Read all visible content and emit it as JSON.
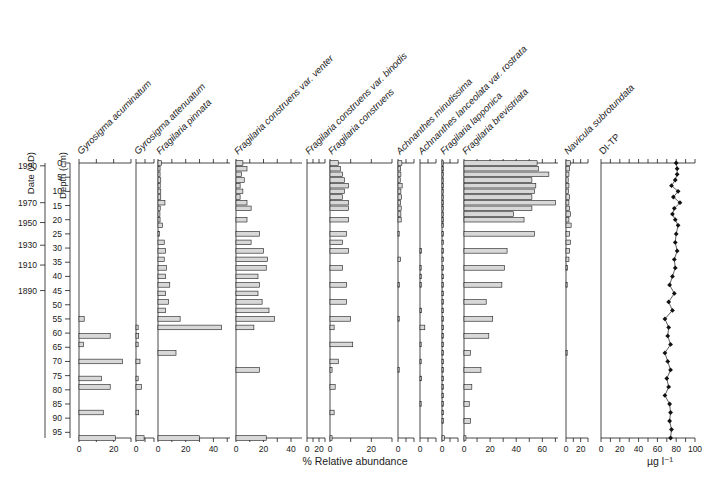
{
  "figure": {
    "type": "stratigraphic-diatom-diagram",
    "x_axis_title": "% Relative abundance",
    "ditp_axis_title": "µg l⁻¹",
    "date_axis_label": "Date (AD)",
    "depth_axis_label": "Depth (cm)"
  },
  "depths": [
    0,
    2,
    4,
    6,
    8,
    10,
    12,
    14,
    16,
    18,
    20,
    22,
    25,
    28,
    31,
    34,
    37,
    40,
    43,
    46,
    49,
    52,
    55,
    58,
    61,
    64,
    67,
    70,
    73,
    76,
    79,
    82,
    85,
    88,
    91,
    94,
    97
  ],
  "depth_ticks": [
    0,
    5,
    10,
    15,
    20,
    25,
    30,
    35,
    40,
    45,
    50,
    55,
    60,
    65,
    70,
    75,
    80,
    85,
    90,
    95
  ],
  "date_ticks": [
    {
      "label": "1990",
      "depth": 1
    },
    {
      "label": "1970",
      "depth": 14
    },
    {
      "label": "1950",
      "depth": 21
    },
    {
      "label": "1930",
      "depth": 29
    },
    {
      "label": "1910",
      "depth": 36
    },
    {
      "label": "1890",
      "depth": 45
    }
  ],
  "chart_data": {
    "type": "bar",
    "title": "",
    "xlabel": "% Relative abundance",
    "ylabel": "Depth (cm)",
    "ylim": [
      0,
      97
    ],
    "grid": false,
    "legend": "none",
    "orientation": "horizontal-bars-by-depth",
    "panels": [
      {
        "name": "Gyrosigma acuminatum",
        "italic": true,
        "units": "%",
        "xlim": [
          0,
          30
        ],
        "ticks": [
          0,
          10,
          20,
          30
        ],
        "tick_labels": [
          "0",
          "",
          "20",
          ""
        ],
        "values": [
          0,
          0,
          0,
          0,
          0,
          0,
          0,
          0,
          0,
          0,
          0,
          0,
          0,
          0,
          0,
          0,
          0,
          0,
          0,
          0,
          0,
          0,
          3,
          0,
          18,
          2.5,
          0,
          25,
          0,
          13,
          18,
          0,
          0,
          14,
          0,
          0,
          21
        ]
      },
      {
        "name": "Gyrosigma attenuatum",
        "italic": true,
        "units": "%",
        "xlim": [
          0,
          10
        ],
        "ticks": [
          0,
          5,
          10
        ],
        "tick_labels": [
          "0",
          "",
          ""
        ],
        "values": [
          0,
          0,
          0,
          0,
          0,
          0,
          0,
          0,
          0,
          0,
          0,
          0,
          0,
          0,
          0,
          0,
          0,
          0,
          0,
          0,
          0,
          0,
          0,
          1.2,
          1.5,
          1.2,
          0,
          2.2,
          0,
          1.2,
          3,
          0,
          0,
          1.5,
          0,
          0,
          4.5
        ]
      },
      {
        "name": "Fragilaria pinnata",
        "italic": true,
        "units": "%",
        "xlim": [
          0,
          52
        ],
        "ticks": [
          0,
          10,
          20,
          30,
          40,
          50
        ],
        "tick_labels": [
          "0",
          "",
          "20",
          "",
          "40",
          ""
        ],
        "values": [
          2.5,
          1.5,
          1.5,
          2.0,
          1.6,
          2.0,
          2.0,
          5.0,
          1.6,
          1.4,
          1.5,
          3.2,
          1.0,
          4.5,
          5.5,
          4.5,
          6.0,
          5.5,
          8.5,
          5.5,
          7.5,
          5.5,
          16,
          46,
          0,
          0,
          13,
          0,
          0,
          0,
          0,
          0,
          0,
          0,
          0,
          0,
          30
        ]
      },
      {
        "name": "Fragilaria construens var. venter",
        "italic": true,
        "units": "%",
        "xlim": [
          0,
          48
        ],
        "ticks": [
          0,
          10,
          20,
          30,
          40
        ],
        "tick_labels": [
          "0",
          "",
          "20",
          "",
          "40"
        ],
        "values": [
          5,
          8,
          4,
          6,
          3,
          5,
          3,
          8,
          11,
          0,
          8,
          0,
          17,
          11,
          20,
          23,
          22,
          16,
          17,
          16,
          19,
          24,
          28,
          13,
          0,
          0,
          0,
          0,
          17,
          0,
          0,
          0,
          0,
          0,
          0,
          0,
          22
        ]
      },
      {
        "name": "Fragilaria construens var. binodis",
        "italic": true,
        "units": "%",
        "xlim": [
          0,
          30
        ],
        "ticks": [
          0,
          10,
          20,
          30
        ],
        "tick_labels": [
          "0",
          "",
          "20",
          ""
        ],
        "values": [
          0,
          0,
          0,
          0,
          0,
          0,
          0,
          0,
          0,
          0,
          0,
          0,
          0,
          0,
          0,
          0,
          0,
          0,
          0,
          0,
          0,
          0,
          0,
          0,
          0,
          0,
          0,
          0,
          0,
          0,
          0,
          0,
          0,
          0,
          0,
          0,
          0
        ]
      },
      {
        "name": "Fragilaria construens",
        "italic": true,
        "units": "%",
        "xlim": [
          0,
          30
        ],
        "ticks": [
          0,
          10,
          20,
          30
        ],
        "tick_labels": [
          "0",
          "",
          "20",
          ""
        ],
        "values": [
          4,
          5,
          6,
          7,
          9,
          7,
          6,
          9,
          9,
          0,
          9,
          0,
          8,
          6,
          9,
          0,
          6,
          0,
          8,
          0,
          8,
          0,
          10,
          2,
          0,
          11,
          0,
          4,
          1,
          0,
          2.5,
          0,
          0,
          2,
          0,
          0,
          1
        ]
      },
      {
        "name": "Achnanthes minutissima",
        "italic": true,
        "units": "%",
        "xlim": [
          0,
          10
        ],
        "ticks": [
          0,
          5,
          10
        ],
        "tick_labels": [
          "0",
          "",
          ""
        ],
        "values": [
          2.4,
          1.6,
          1.8,
          1.4,
          2.6,
          1.8,
          2.2,
          1.6,
          2.0,
          1.8,
          2.0,
          0,
          0.7,
          0,
          0,
          1.6,
          0,
          0,
          0.8,
          0,
          0,
          0,
          0.7,
          0,
          0,
          0,
          0,
          0,
          0.6,
          0,
          0,
          0,
          0,
          0,
          0,
          0,
          0
        ]
      },
      {
        "name": "Achnanthes lanceolata var. rostrata",
        "italic": true,
        "units": "%",
        "xlim": [
          0,
          10
        ],
        "ticks": [
          0,
          5,
          10
        ],
        "tick_labels": [
          "0",
          "",
          ""
        ],
        "values": [
          0,
          0,
          0,
          0,
          0,
          0,
          0,
          0,
          0,
          0,
          0,
          0,
          0,
          0,
          1.0,
          0,
          0.5,
          0.8,
          0.8,
          0,
          0,
          1.0,
          0,
          3.0,
          0,
          0.6,
          0,
          0.6,
          0,
          1.0,
          0,
          0,
          0.7,
          0,
          0,
          0,
          0
        ]
      },
      {
        "name": "Fragilaria lapponica",
        "italic": true,
        "units": "%",
        "xlim": [
          0,
          10
        ],
        "ticks": [
          0,
          5,
          10
        ],
        "tick_labels": [
          "0",
          "",
          ""
        ],
        "values": [
          1.0,
          1.0,
          1.0,
          1.0,
          1.0,
          1.0,
          1.0,
          1.0,
          1.0,
          1.0,
          1.0,
          1.0,
          1.0,
          1.0,
          1.0,
          1.0,
          1.0,
          1.0,
          1.0,
          1.0,
          1.0,
          1.0,
          1.0,
          1.0,
          1.0,
          1.0,
          1.0,
          1.0,
          1.0,
          1.0,
          1.0,
          1.0,
          1.0,
          1.0,
          1.0,
          0,
          1.5
        ]
      },
      {
        "name": "Fragilaria brevistriata",
        "italic": true,
        "units": "%",
        "xlim": [
          0,
          72
        ],
        "ticks": [
          0,
          10,
          20,
          30,
          40,
          50,
          60,
          70
        ],
        "tick_labels": [
          "0",
          "",
          "20",
          "",
          "40",
          "",
          "60",
          ""
        ],
        "values": [
          56,
          57,
          65,
          52,
          55,
          54,
          52,
          70,
          52,
          38,
          46,
          0,
          54,
          0,
          33,
          0,
          31,
          0,
          29,
          0,
          17,
          0,
          22,
          0,
          19,
          0,
          5,
          0,
          13,
          0,
          6,
          0,
          4,
          0,
          5,
          0,
          1.5
        ]
      },
      {
        "name": "Navicula subrotundata",
        "italic": true,
        "units": "%",
        "xlim": [
          0,
          30
        ],
        "ticks": [
          0,
          10,
          20,
          30
        ],
        "tick_labels": [
          "0",
          "",
          "20",
          ""
        ],
        "values": [
          6,
          5,
          4,
          3,
          4,
          3.5,
          5,
          4,
          5,
          6,
          4,
          7,
          5,
          6,
          5,
          4,
          2,
          0,
          1.5,
          0,
          0,
          0,
          0,
          0,
          0,
          0,
          0.8,
          0,
          0,
          0,
          0,
          0,
          0,
          0,
          0,
          0,
          0
        ]
      }
    ],
    "line_panel": {
      "name": "DI-TP",
      "italic": false,
      "units": "µg l⁻¹",
      "xlim": [
        0,
        100
      ],
      "ticks": [
        0,
        10,
        20,
        30,
        40,
        50,
        60,
        70,
        80,
        90,
        100
      ],
      "tick_labels": [
        "0",
        "",
        "20",
        "",
        "40",
        "",
        "60",
        "",
        "80",
        "",
        "100"
      ],
      "marker": "filled-diamond",
      "values": [
        80,
        81,
        81,
        79,
        75,
        82,
        77,
        84,
        78,
        76,
        79,
        82,
        80,
        79,
        81,
        78,
        79,
        76,
        73,
        78,
        72,
        76,
        68,
        72,
        71,
        74,
        68,
        71,
        74,
        70,
        72,
        68,
        73,
        74,
        73,
        75,
        74
      ]
    }
  }
}
